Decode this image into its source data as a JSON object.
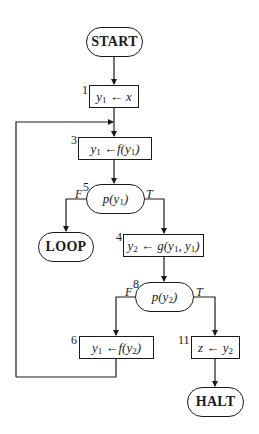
{
  "flowchart": {
    "start": {
      "label": "START"
    },
    "loop": {
      "label": "LOOP"
    },
    "halt": {
      "label": "HALT"
    },
    "nodes": [
      {
        "id": "1",
        "number": "1",
        "type": "assignment",
        "text": "y1 ← x"
      },
      {
        "id": "3",
        "number": "3",
        "type": "assignment",
        "text": "y1 ← f(y1)"
      },
      {
        "id": "5",
        "number": "5",
        "type": "test",
        "text": "p(y1)"
      },
      {
        "id": "4",
        "number": "4",
        "type": "assignment",
        "text": "y2 ← g(y1, y1)"
      },
      {
        "id": "8",
        "number": "8",
        "type": "test",
        "text": "p(y2)"
      },
      {
        "id": "6",
        "number": "6",
        "type": "assignment",
        "text": "y1 ← f(y2)"
      },
      {
        "id": "11",
        "number": "11",
        "type": "assignment",
        "text": "z ← y2"
      }
    ],
    "branch_labels": {
      "false": "F",
      "true": "T"
    },
    "edges": [
      {
        "from": "START",
        "to": "1"
      },
      {
        "from": "1",
        "to": "3"
      },
      {
        "from": "3",
        "to": "5"
      },
      {
        "from": "5",
        "to": "LOOP",
        "label": "F"
      },
      {
        "from": "5",
        "to": "4",
        "label": "T"
      },
      {
        "from": "4",
        "to": "8"
      },
      {
        "from": "8",
        "to": "6",
        "label": "F"
      },
      {
        "from": "8",
        "to": "11",
        "label": "T"
      },
      {
        "from": "6",
        "to": "3"
      },
      {
        "from": "11",
        "to": "HALT"
      }
    ]
  }
}
